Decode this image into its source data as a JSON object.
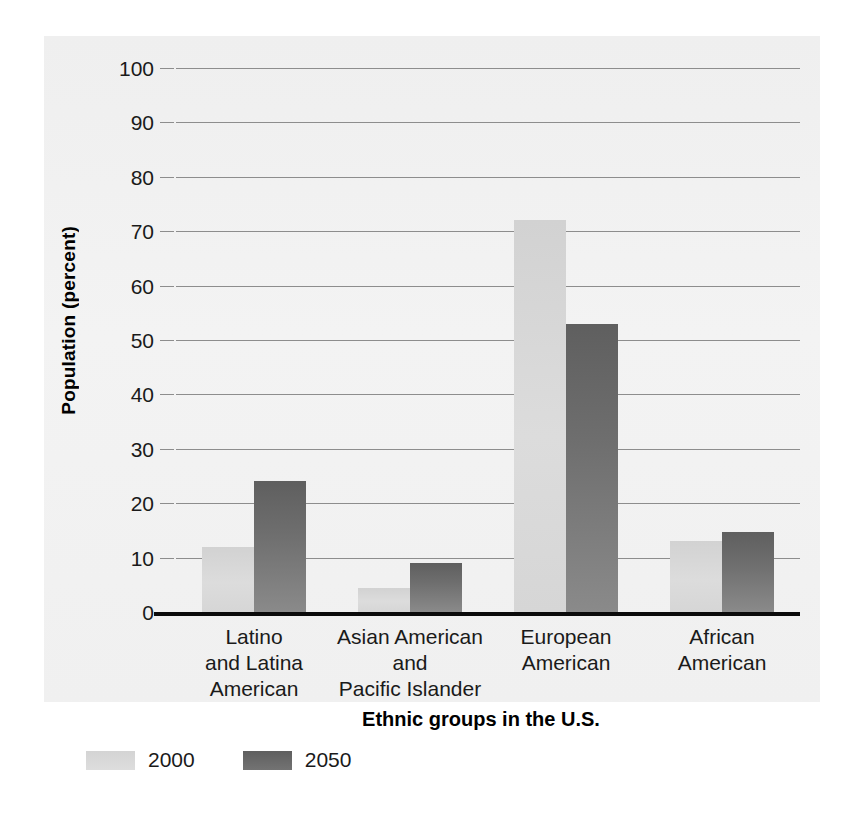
{
  "chart_data": {
    "type": "bar",
    "title": "",
    "xlabel": "Ethnic groups in the U.S.",
    "ylabel": "Population (percent)",
    "categories": [
      "Latino and Latina American",
      "Asian American and Pacific Islander",
      "European American",
      "African American"
    ],
    "category_label_lines": [
      [
        "Latino",
        "and Latina",
        "American"
      ],
      [
        "Asian American",
        "and",
        "Pacific Islander"
      ],
      [
        "European",
        "American"
      ],
      [
        "African",
        "American"
      ]
    ],
    "series": [
      {
        "name": "2000",
        "color": "#d8d8d8",
        "values": [
          12,
          4.5,
          72,
          13
        ]
      },
      {
        "name": "2050",
        "color": "#6b6b6b",
        "values": [
          24,
          9,
          53,
          14.7
        ]
      }
    ],
    "ylim": [
      0,
      100
    ],
    "yticks": [
      0,
      10,
      20,
      30,
      40,
      50,
      60,
      70,
      80,
      90,
      100
    ],
    "ytick_labels": [
      "0",
      "10",
      "20",
      "30",
      "40",
      "50",
      "60",
      "70",
      "80",
      "90",
      "100"
    ],
    "grid": true,
    "grid_color": "#8d8d8d",
    "legend_position": "bottom-left",
    "background_color": "#f1f1f1",
    "axis_color": "#0b0b0b"
  }
}
